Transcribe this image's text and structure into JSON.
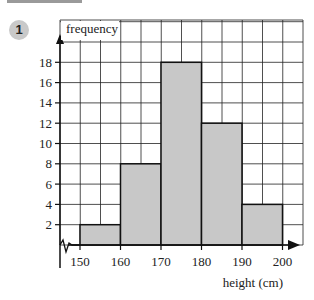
{
  "question": {
    "number": "1"
  },
  "chart_data": {
    "type": "bar",
    "subtype": "histogram",
    "title": "",
    "xlabel": "height (cm)",
    "ylabel": "frequency",
    "bin_edges": [
      150,
      160,
      170,
      180,
      190,
      200
    ],
    "categories": [
      "150-160",
      "160-170",
      "170-180",
      "180-190",
      "190-200"
    ],
    "values": [
      2,
      8,
      18,
      12,
      4
    ],
    "x_ticks": [
      150,
      160,
      170,
      180,
      190,
      200
    ],
    "y_ticks": [
      2,
      4,
      6,
      8,
      10,
      12,
      14,
      16,
      18
    ],
    "xlim": [
      145,
      205
    ],
    "ylim": [
      0,
      22
    ],
    "grid": true,
    "x_axis_break": true,
    "bar_color": "#c8c8c8",
    "grid_color": "#222222"
  }
}
